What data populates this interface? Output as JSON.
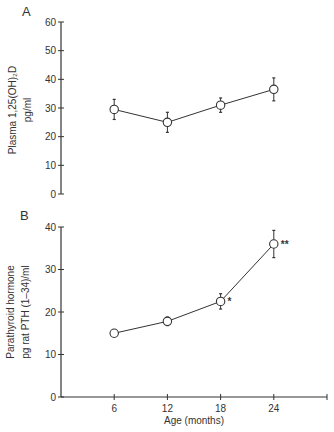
{
  "figure": {
    "panels": [
      "A",
      "B"
    ]
  },
  "chart_data": [
    {
      "panel": "A",
      "type": "line",
      "title": "",
      "xlabel": "",
      "ylabel": "Plasma 1,25(OH)₂D",
      "ylabel_units": "pg/ml",
      "x": [
        6,
        12,
        18,
        24
      ],
      "series": [
        {
          "name": "Plasma 1,25(OH)2D",
          "values": [
            29.5,
            25,
            31,
            36.5
          ],
          "errors": [
            3.5,
            3.5,
            2.5,
            4
          ],
          "annotations": [
            "",
            "",
            "",
            ""
          ]
        }
      ],
      "ylim": [
        0,
        60
      ],
      "yticks": [
        0,
        10,
        20,
        30,
        40,
        50,
        60
      ],
      "xlim": [
        0,
        30
      ],
      "xaxis_visible": false,
      "grid": false,
      "legend": null
    },
    {
      "panel": "B",
      "type": "line",
      "title": "",
      "xlabel": "Age (months)",
      "ylabel": "Parathyroid hormone",
      "ylabel_units": "pg rat PTH (1–34)/ml",
      "x": [
        6,
        12,
        18,
        24
      ],
      "series": [
        {
          "name": "Parathyroid hormone",
          "values": [
            15,
            17.8,
            22.5,
            36
          ],
          "errors": [
            0.5,
            1,
            1.8,
            3.2
          ],
          "annotations": [
            "",
            "",
            "*",
            "**"
          ]
        }
      ],
      "ylim": [
        0,
        40
      ],
      "yticks": [
        0,
        10,
        20,
        30,
        40
      ],
      "xlim": [
        0,
        30
      ],
      "xticks": [
        6,
        12,
        18,
        24,
        30
      ],
      "xticklabels": [
        "6",
        "12",
        "18",
        "24",
        ""
      ],
      "xaxis_visible": true,
      "grid": false,
      "legend": null
    }
  ]
}
